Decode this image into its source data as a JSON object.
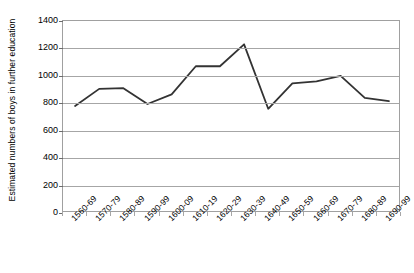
{
  "chart_data": {
    "type": "line",
    "title": "",
    "xlabel": "",
    "ylabel": "Estimated numbers of boys in further education",
    "categories": [
      "1560-69",
      "1570-79",
      "1580-89",
      "1590-99",
      "1600-09",
      "1610-19",
      "1620-29",
      "1630-39",
      "1640-49",
      "1650-59",
      "1660-69",
      "1670-79",
      "1680-89",
      "1690-99"
    ],
    "values": [
      780,
      905,
      910,
      795,
      865,
      1070,
      1070,
      1230,
      760,
      945,
      960,
      1000,
      840,
      815
    ],
    "series": [
      {
        "name": "Estimated numbers of boys in further education",
        "values": [
          780,
          905,
          910,
          795,
          865,
          1070,
          1070,
          1230,
          760,
          945,
          960,
          1000,
          840,
          815
        ]
      }
    ],
    "ylim": [
      0,
      1400
    ],
    "yticks": [
      0,
      200,
      400,
      600,
      800,
      1000,
      1200,
      1400
    ],
    "ytick_labels": [
      "0",
      "200",
      "400",
      "600",
      "800",
      "1000",
      "1200",
      "1400"
    ],
    "grid": true,
    "legend": "none",
    "line_color": "#333333",
    "grid_color": "#a6a6a6",
    "axis_color": "#a0a0a0",
    "background": "#ffffff"
  }
}
